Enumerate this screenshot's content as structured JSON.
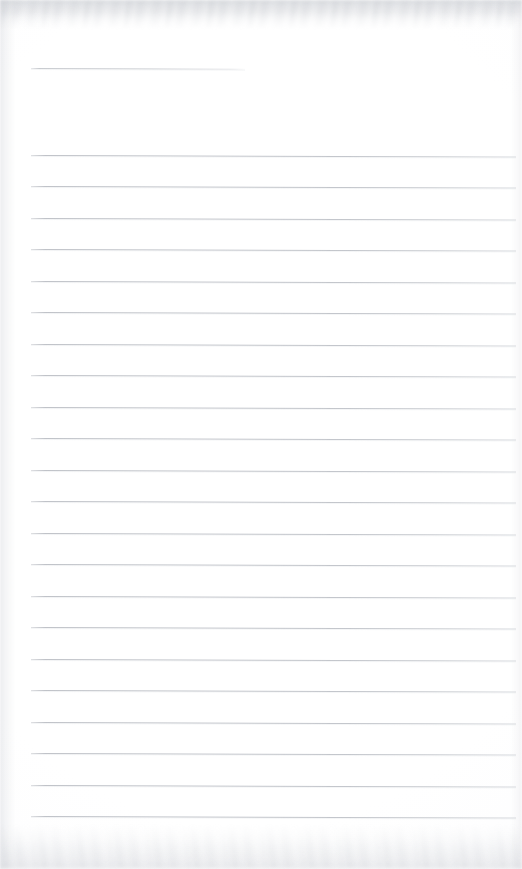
{
  "page": {
    "kind": "scanned-lined-notebook-page",
    "title": "",
    "width": 522,
    "height": 869,
    "background_color": "#fefefe",
    "text_content": "",
    "visible_text": [],
    "annotations": [],
    "paper": {
      "rule_color": "#c0c3c9",
      "rule_thickness_px": 1,
      "rule_spacing_px": 31.5,
      "left_margin_px": 31,
      "right_edge_px": 516,
      "tilt_degrees": 0.18,
      "noise_color": "#c4c7cd"
    },
    "rules": [
      {
        "name": "header-rule",
        "y": 68,
        "x": 31,
        "width": 214,
        "short": true
      },
      {
        "name": "body-rule-1",
        "y": 154.5,
        "x": 31,
        "width": 485,
        "short": false
      },
      {
        "name": "body-rule-2",
        "y": 186.0,
        "x": 31,
        "width": 485,
        "short": false
      },
      {
        "name": "body-rule-3",
        "y": 217.5,
        "x": 31,
        "width": 485,
        "short": false
      },
      {
        "name": "body-rule-4",
        "y": 249.0,
        "x": 31,
        "width": 485,
        "short": false
      },
      {
        "name": "body-rule-5",
        "y": 280.5,
        "x": 31,
        "width": 485,
        "short": false
      },
      {
        "name": "body-rule-6",
        "y": 312.0,
        "x": 31,
        "width": 485,
        "short": false
      },
      {
        "name": "body-rule-7",
        "y": 343.5,
        "x": 31,
        "width": 485,
        "short": false
      },
      {
        "name": "body-rule-8",
        "y": 375.0,
        "x": 31,
        "width": 485,
        "short": false
      },
      {
        "name": "body-rule-9",
        "y": 406.5,
        "x": 31,
        "width": 485,
        "short": false
      },
      {
        "name": "body-rule-10",
        "y": 438.0,
        "x": 31,
        "width": 485,
        "short": false
      },
      {
        "name": "body-rule-11",
        "y": 469.5,
        "x": 31,
        "width": 485,
        "short": false
      },
      {
        "name": "body-rule-12",
        "y": 501.0,
        "x": 31,
        "width": 485,
        "short": false
      },
      {
        "name": "body-rule-13",
        "y": 532.5,
        "x": 31,
        "width": 485,
        "short": false
      },
      {
        "name": "body-rule-14",
        "y": 564.0,
        "x": 31,
        "width": 485,
        "short": false
      },
      {
        "name": "body-rule-15",
        "y": 595.5,
        "x": 31,
        "width": 485,
        "short": false
      },
      {
        "name": "body-rule-16",
        "y": 627.0,
        "x": 31,
        "width": 485,
        "short": false
      },
      {
        "name": "body-rule-17",
        "y": 658.5,
        "x": 31,
        "width": 485,
        "short": false
      },
      {
        "name": "body-rule-18",
        "y": 690.0,
        "x": 31,
        "width": 485,
        "short": false
      },
      {
        "name": "body-rule-19",
        "y": 721.5,
        "x": 31,
        "width": 485,
        "short": false
      },
      {
        "name": "body-rule-20",
        "y": 753.0,
        "x": 31,
        "width": 485,
        "short": false
      },
      {
        "name": "body-rule-21",
        "y": 784.5,
        "x": 31,
        "width": 485,
        "short": false
      },
      {
        "name": "body-rule-22",
        "y": 816.0,
        "x": 31,
        "width": 485,
        "short": false
      }
    ]
  }
}
